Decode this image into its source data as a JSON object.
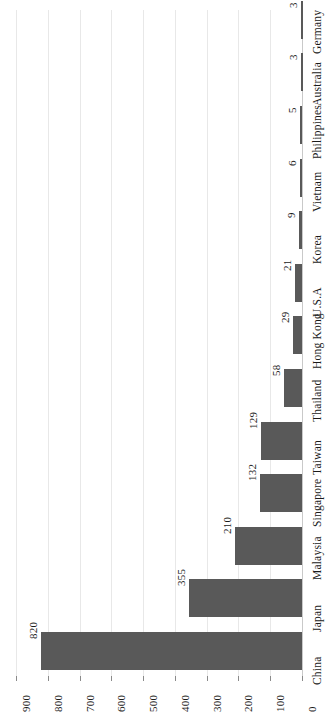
{
  "chart_data": {
    "type": "bar",
    "title": "",
    "subtitle": "",
    "xlabel": "",
    "ylabel": "",
    "orientation": "horizontal-rotated",
    "grid": true,
    "legend": false,
    "ylim": [
      0,
      900
    ],
    "tick_step": 100,
    "tick_labels": [
      "900",
      "800",
      "700",
      "600",
      "500",
      "400",
      "300",
      "200",
      "100",
      "0"
    ],
    "categories": [
      "China",
      "Japan",
      "Malaysia",
      "Singapore",
      "Taiwan",
      "Thailand",
      "Hong Kong",
      "U.S.A",
      "Korea",
      "Vietnam",
      "Philippines",
      "Australia",
      "Germany"
    ],
    "values": [
      820,
      355,
      210,
      132,
      129,
      58,
      29,
      21,
      9,
      6,
      5,
      3,
      3
    ],
    "value_labels": [
      "820",
      "355",
      "210",
      "132",
      "129",
      "58",
      "29",
      "21",
      "9",
      "6",
      "5",
      "3",
      "3"
    ],
    "bar_color": "#595959",
    "gridline_color": "#e8e8e8",
    "axis_color": "#c9c9c9",
    "text_color": "#1a1a1a",
    "background_color": "#ffffff"
  }
}
